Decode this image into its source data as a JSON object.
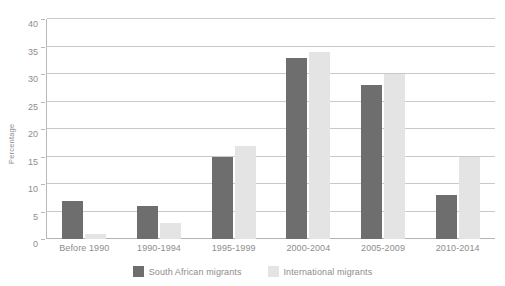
{
  "figure": {
    "clipped_title": "",
    "y_axis_title": "Percentage"
  },
  "colors": {
    "series_south_african": "#6e6e6e",
    "series_international": "#e4e4e4",
    "gridline": "#c9c9c9",
    "axis": "#b9b9b9",
    "text": "#8d8d8d"
  },
  "legend": {
    "position": "bottom-center",
    "entries": [
      {
        "label": "South African migrants",
        "color": "#6e6e6e"
      },
      {
        "label": "International migrants",
        "color": "#e4e4e4"
      }
    ]
  },
  "chart_data": {
    "type": "bar",
    "title": "",
    "xlabel": "",
    "ylabel": "Percentage",
    "ylim": [
      0,
      40
    ],
    "yticks": [
      0,
      5,
      10,
      15,
      20,
      25,
      30,
      35,
      40
    ],
    "ytick_labels": [
      "0",
      "5",
      "10",
      "15",
      "20",
      "25",
      "30",
      "35",
      "40"
    ],
    "grid": true,
    "grid_axis": "y",
    "legend_position": "bottom-center",
    "categories": [
      "Before 1990",
      "1990-1994",
      "1995-1999",
      "2000-2004",
      "2005-2009",
      "2010-2014"
    ],
    "series": [
      {
        "name": "South African migrants",
        "color": "#6e6e6e",
        "values": [
          7,
          6,
          15,
          33,
          28,
          8
        ]
      },
      {
        "name": "International migrants",
        "color": "#e4e4e4",
        "values": [
          1,
          3,
          17,
          34,
          30,
          15
        ]
      }
    ]
  }
}
